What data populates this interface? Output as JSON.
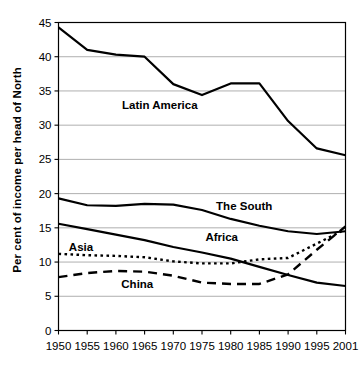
{
  "chart_data": {
    "type": "line",
    "title": "",
    "xlabel": "",
    "ylabel": "Per cent of income per head of North",
    "x": [
      1950,
      1955,
      1960,
      1965,
      1970,
      1975,
      1980,
      1985,
      1990,
      1995,
      2001
    ],
    "xticklabels": [
      "1950",
      "1955",
      "1960",
      "1965",
      "1970",
      "1975",
      "1980",
      "1985",
      "1990",
      "1995",
      "2001"
    ],
    "yticklabels": [
      "0",
      "5",
      "10",
      "15",
      "20",
      "25",
      "30",
      "35",
      "40",
      "45"
    ],
    "ylim": [
      0,
      45
    ],
    "xlim": [
      1950,
      2001
    ],
    "grid": true,
    "legend": "inline-labels",
    "series": [
      {
        "name": "Latin America",
        "style": "solid",
        "width": 2.2,
        "values": [
          44.3,
          41.0,
          40.3,
          40.0,
          36.0,
          34.4,
          36.1,
          36.1,
          30.6,
          26.6,
          25.6
        ],
        "label_x": 1968,
        "label_y": 32.3
      },
      {
        "name": "The South",
        "style": "solid",
        "width": 2.2,
        "values": [
          19.3,
          18.3,
          18.2,
          18.5,
          18.4,
          17.6,
          16.3,
          15.3,
          14.5,
          14.1,
          14.5
        ],
        "label_x": 1983,
        "label_y": 17.6
      },
      {
        "name": "Africa",
        "style": "solid",
        "width": 2.2,
        "values": [
          15.6,
          14.8,
          14.0,
          13.2,
          12.2,
          11.4,
          10.5,
          9.3,
          8.1,
          7.0,
          6.5
        ],
        "label_x": 1979,
        "label_y": 13.1
      },
      {
        "name": "Asia",
        "style": "dotted",
        "width": 2.4,
        "values": [
          11.2,
          11.0,
          10.9,
          10.7,
          10.1,
          9.8,
          9.8,
          10.4,
          10.6,
          12.7,
          14.8
        ],
        "label_x": 1954.0,
        "label_y": 11.6
      },
      {
        "name": "China",
        "style": "dashed",
        "width": 2.4,
        "values": [
          7.8,
          8.4,
          8.7,
          8.6,
          8.0,
          7.0,
          6.8,
          6.8,
          8.2,
          11.8,
          15.2
        ],
        "label_x": 1964,
        "label_y": 6.2
      }
    ]
  }
}
